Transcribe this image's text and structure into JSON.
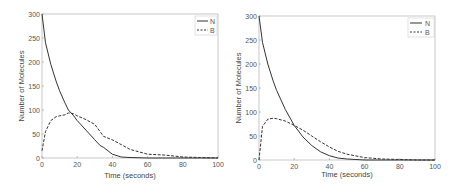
{
  "chart_data": [
    {
      "type": "line",
      "panel": "left (stochastic simulation)",
      "title": "",
      "xlabel": "Time (seconds)",
      "ylabel": "Number of Molecules",
      "xlim": [
        0,
        100
      ],
      "ylim": [
        0,
        300
      ],
      "xticks": [
        0,
        20,
        40,
        60,
        80,
        100
      ],
      "yticks": [
        0,
        50,
        100,
        150,
        200,
        250,
        300
      ],
      "grid": false,
      "legend": {
        "position": "upper right",
        "entries": [
          {
            "label": "N",
            "style": "solid"
          },
          {
            "label": "B",
            "style": "dashed"
          }
        ]
      },
      "x": [
        0,
        2,
        5,
        8,
        10,
        13,
        15,
        18,
        20,
        25,
        30,
        33,
        35,
        40,
        45,
        50,
        60,
        70,
        80,
        90,
        100
      ],
      "series": [
        {
          "name": "N",
          "style": "solid",
          "values": [
            300,
            240,
            195,
            160,
            140,
            115,
            100,
            88,
            78,
            58,
            38,
            26,
            22,
            8,
            2,
            1,
            0,
            0,
            0,
            0,
            0
          ]
        },
        {
          "name": "B",
          "style": "dashed",
          "values": [
            15,
            55,
            78,
            86,
            88,
            90,
            94,
            92,
            88,
            80,
            70,
            55,
            45,
            38,
            28,
            18,
            8,
            6,
            2,
            1,
            0
          ]
        }
      ]
    },
    {
      "type": "line",
      "panel": "right (deterministic)",
      "title": "",
      "xlabel": "Time (seconds)",
      "ylabel": "Number of Molecules",
      "xlim": [
        0,
        100
      ],
      "ylim": [
        0,
        300
      ],
      "xticks": [
        0,
        20,
        40,
        60,
        80,
        100
      ],
      "yticks": [
        0,
        50,
        100,
        150,
        200,
        250,
        300
      ],
      "grid": false,
      "legend": {
        "position": "upper right",
        "entries": [
          {
            "label": "N",
            "style": "solid"
          },
          {
            "label": "B",
            "style": "dashed"
          }
        ]
      },
      "x": [
        0,
        2,
        5,
        8,
        10,
        15,
        20,
        25,
        30,
        35,
        40,
        45,
        50,
        60,
        70,
        80,
        90,
        100
      ],
      "series": [
        {
          "name": "N",
          "style": "solid",
          "values": [
            300,
            245,
            200,
            165,
            145,
            105,
            72,
            48,
            30,
            17,
            9,
            4,
            2,
            0,
            0,
            0,
            0,
            0
          ]
        },
        {
          "name": "B",
          "style": "dashed",
          "values": [
            0,
            70,
            85,
            87,
            86,
            81,
            72,
            62,
            50,
            38,
            27,
            18,
            12,
            5,
            2,
            1,
            0,
            0
          ]
        }
      ]
    }
  ],
  "panels": [
    {
      "xlabel": "Time (seconds)",
      "ylabel": "Number of Molecules",
      "legend_n": "N",
      "legend_b": "B"
    },
    {
      "xlabel": "Time (seconds)",
      "ylabel": "Number of Molecules",
      "legend_n": "N",
      "legend_b": "B"
    }
  ]
}
